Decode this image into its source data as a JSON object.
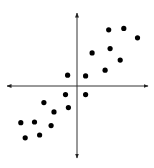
{
  "chart_data": {
    "type": "scatter",
    "title": "",
    "xlabel": "",
    "ylabel": "",
    "grid": false,
    "legend": null,
    "axes": "cross-axes with arrowheads, no tick labels",
    "axis_origin_px": {
      "x": 77,
      "y": 86
    },
    "xlim": [
      -10,
      10
    ],
    "ylim": [
      -10,
      10
    ],
    "series": [
      {
        "name": "points",
        "color": "#000000",
        "points": [
          {
            "x": 4.4,
            "y": 7.8
          },
          {
            "x": 6.5,
            "y": 8.0
          },
          {
            "x": 8.4,
            "y": 6.7
          },
          {
            "x": 2.1,
            "y": 4.6
          },
          {
            "x": 4.6,
            "y": 5.2
          },
          {
            "x": 6.0,
            "y": 3.6
          },
          {
            "x": 3.9,
            "y": 2.2
          },
          {
            "x": 1.2,
            "y": 1.4
          },
          {
            "x": -1.3,
            "y": 1.5
          },
          {
            "x": -1.6,
            "y": -1.2
          },
          {
            "x": 1.2,
            "y": -1.2
          },
          {
            "x": -4.6,
            "y": -2.3
          },
          {
            "x": -1.2,
            "y": -3.0
          },
          {
            "x": -3.2,
            "y": -3.6
          },
          {
            "x": -7.8,
            "y": -5.1
          },
          {
            "x": -5.9,
            "y": -5.0
          },
          {
            "x": -3.6,
            "y": -5.5
          },
          {
            "x": -7.2,
            "y": -7.2
          },
          {
            "x": -5.2,
            "y": -6.8
          }
        ]
      }
    ]
  }
}
